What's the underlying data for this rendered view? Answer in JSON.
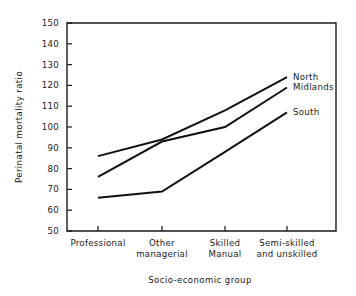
{
  "chart_data": {
    "type": "line",
    "title": "",
    "xlabel": "Socio-economic group",
    "ylabel": "Perinatal mortality ratio",
    "categories": [
      "Professional",
      "Other managerial",
      "Skilled Manual",
      "Semi-skilled and unskilled"
    ],
    "category_lines": [
      [
        "Professional"
      ],
      [
        "Other",
        "managerial"
      ],
      [
        "Skilled",
        "Manual"
      ],
      [
        "Semi-skilled",
        "and unskilled"
      ]
    ],
    "ylim": [
      50,
      150
    ],
    "yticks": [
      50,
      60,
      70,
      80,
      90,
      100,
      110,
      120,
      130,
      140,
      150
    ],
    "ytick_labels": [
      "50",
      "60",
      "70",
      "80",
      "90",
      "100",
      "110",
      "120",
      "130",
      "140",
      "150"
    ],
    "grid": false,
    "legend_position": "right-inline-labels",
    "series": [
      {
        "name": "North",
        "label": "North",
        "values": [
          86,
          94,
          108,
          124
        ]
      },
      {
        "name": "Midlands",
        "label": "Midlands",
        "values": [
          76,
          93,
          100,
          119
        ]
      },
      {
        "name": "South",
        "label": "South",
        "values": [
          66,
          69,
          88,
          107
        ]
      }
    ]
  },
  "figure": {
    "background_color": "#ffffff",
    "line_color": "#111111",
    "axis_color": "#1a1a1a"
  }
}
